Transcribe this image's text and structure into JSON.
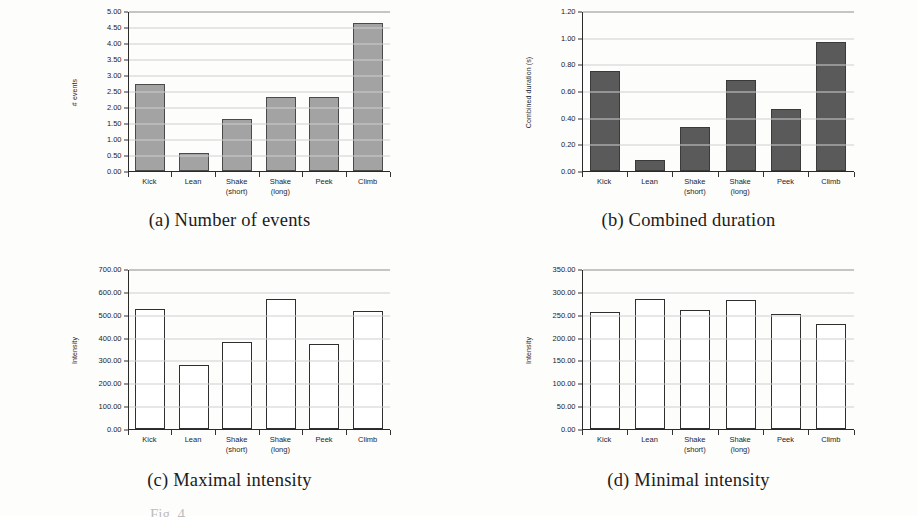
{
  "figure": {
    "fig_label": "Fig. 4.",
    "categories": [
      "Kick",
      "Lean",
      "Shake",
      "Shake",
      "Peek",
      "Climb"
    ],
    "category_sublabels": [
      "",
      "",
      "(short)",
      "(long)",
      "",
      ""
    ]
  },
  "panels": [
    {
      "caption": "(a) Number of events"
    },
    {
      "caption": "(b) Combined duration"
    },
    {
      "caption": "(c) Maximal intensity"
    },
    {
      "caption": "(d) Minimal intensity"
    }
  ],
  "chart_data": [
    {
      "type": "bar",
      "title": "(a) Number of events",
      "categories": [
        "Kick",
        "Lean",
        "Shake (short)",
        "Shake (long)",
        "Peek",
        "Climb"
      ],
      "values": [
        2.72,
        0.56,
        1.61,
        2.32,
        2.3,
        4.62
      ],
      "xlabel": "",
      "ylabel": "# events",
      "ylim": [
        0.0,
        5.0
      ],
      "ytick_step": 0.5,
      "yticks": [
        "5.00",
        "4.50",
        "4.00",
        "3.50",
        "3.00",
        "2.50",
        "2.00",
        "1.50",
        "1.00",
        "0.50",
        "0.00"
      ],
      "grid": true,
      "legend": "none",
      "bar_style": "filled-light",
      "bar_color": "#a3a3a3"
    },
    {
      "type": "bar",
      "title": "(b) Combined duration",
      "categories": [
        "Kick",
        "Lean",
        "Shake (short)",
        "Shake (long)",
        "Peek",
        "Climb"
      ],
      "values": [
        0.75,
        0.08,
        0.33,
        0.685,
        0.465,
        0.965
      ],
      "xlabel": "",
      "ylabel": "Combined duration (s)",
      "ylim": [
        0.0,
        1.2
      ],
      "ytick_step": 0.2,
      "yticks": [
        "1.20",
        "1.00",
        "0.80",
        "0.60",
        "0.40",
        "0.20",
        "0.00"
      ],
      "grid": true,
      "legend": "none",
      "bar_style": "filled-dark",
      "bar_color": "#5a5a5a"
    },
    {
      "type": "bar",
      "title": "(c) Maximal intensity",
      "categories": [
        "Kick",
        "Lean",
        "Shake (short)",
        "Shake (long)",
        "Peek",
        "Climb"
      ],
      "values": [
        523,
        282,
        382,
        568,
        372,
        518
      ],
      "xlabel": "",
      "ylabel": "Intensity",
      "ylim": [
        0.0,
        700.0
      ],
      "ytick_step": 100.0,
      "yticks": [
        "700.00",
        "600.00",
        "500.00",
        "400.00",
        "300.00",
        "200.00",
        "100.00",
        "0.00"
      ],
      "grid": true,
      "legend": "none",
      "bar_style": "hollow",
      "bar_color": "#ffffff"
    },
    {
      "type": "bar",
      "title": "(d) Minimal intensity",
      "categories": [
        "Kick",
        "Lean",
        "Shake (short)",
        "Shake (long)",
        "Peek",
        "Climb"
      ],
      "values": [
        257,
        284,
        260,
        283,
        251,
        229
      ],
      "xlabel": "",
      "ylabel": "Intensity",
      "ylim": [
        0.0,
        350.0
      ],
      "ytick_step": 50.0,
      "yticks": [
        "350.00",
        "300.00",
        "250.00",
        "200.00",
        "150.00",
        "100.00",
        "50.00",
        "0.00"
      ],
      "grid": true,
      "legend": "none",
      "bar_style": "hollow",
      "bar_color": "#ffffff"
    }
  ]
}
